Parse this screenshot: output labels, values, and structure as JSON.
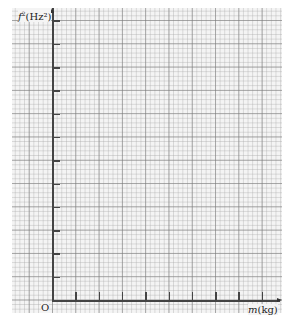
{
  "chart_data": {
    "type": "scatter",
    "title": "",
    "xlabel": "m (kg)",
    "ylabel": "f² (Hz²)",
    "x_var": "m",
    "x_unit": "(kg)",
    "y_var": "f",
    "y_sup": "2",
    "y_unit": "(Hz²)",
    "origin_label": "O",
    "x": [],
    "y": [],
    "grid": true,
    "grid_style": "graph paper, major squares with 5×5 minor subdivisions",
    "x_ticks_count": 9,
    "y_ticks_count": 12,
    "xlim": null,
    "ylim": null,
    "note": "Blank graph paper with labelled axes; no data plotted"
  },
  "axes": {
    "y_label_var": "f",
    "y_label_sup": "2",
    "y_label_unit": "(Hz²)",
    "x_label_var": "m",
    "x_label_unit": "(kg)",
    "origin": "O"
  },
  "colors": {
    "axis": "#444444",
    "paper": "#f4f4f4",
    "grid_major": "#8c8c8c",
    "grid_minor": "#c4c4c4"
  }
}
